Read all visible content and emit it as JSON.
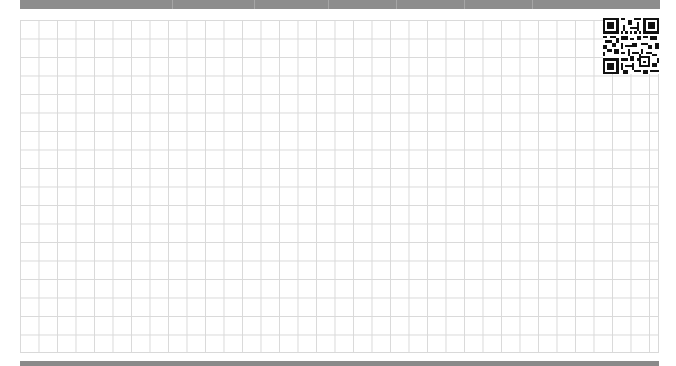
{
  "page": {
    "type": "grid-paper",
    "grid": {
      "columns": 34,
      "rows": 18,
      "cell_size_px": 18.5,
      "line_color": "#d9d9d9"
    },
    "top_bar": {
      "color": "#8d8d8d"
    },
    "bottom_bar": {
      "color": "#8a8a8a"
    },
    "qr_code": {
      "position": "top-right",
      "icon": "qr-code-icon"
    }
  }
}
